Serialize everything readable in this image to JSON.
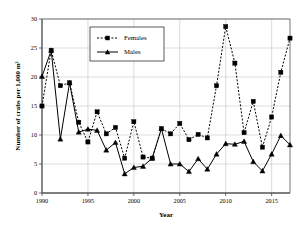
{
  "chart_data": {
    "type": "line",
    "title": "",
    "subtitle": "",
    "xlabel": "Year",
    "ylabel": "Number of crabs per 1,000 m²",
    "xlim": [
      1990,
      2017
    ],
    "ylim": [
      0,
      30
    ],
    "ytick_labels": [
      "0",
      "5",
      "10",
      "15",
      "20",
      "25",
      "30"
    ],
    "yticks": [
      0,
      5,
      10,
      15,
      20,
      25,
      30
    ],
    "xtick_labels": [
      "1990",
      "1995",
      "2000",
      "2005",
      "2010",
      "2015"
    ],
    "xticks": [
      1990,
      1995,
      2000,
      2005,
      2010,
      2015
    ],
    "grid": "horizontal-and-vertical",
    "legend_position": "top-center",
    "x": [
      1990,
      1991,
      1992,
      1993,
      1994,
      1995,
      1996,
      1997,
      1998,
      1999,
      2000,
      2001,
      2002,
      2003,
      2004,
      2005,
      2006,
      2007,
      2008,
      2009,
      2010,
      2011,
      2012,
      2013,
      2014,
      2015,
      2016,
      2017
    ],
    "series": [
      {
        "name": "Females",
        "marker": "square",
        "linestyle": "dashed",
        "color": "#000000",
        "values": [
          15.0,
          24.6,
          18.5,
          19.0,
          12.2,
          8.8,
          14.0,
          10.2,
          11.3,
          6.0,
          12.3,
          6.2,
          6.0,
          11.1,
          10.2,
          12.0,
          9.2,
          10.1,
          9.5,
          18.5,
          28.7,
          22.4,
          10.4,
          15.8,
          7.9,
          13.1,
          20.8,
          26.7
        ]
      },
      {
        "name": "Males",
        "marker": "triangle",
        "linestyle": "solid",
        "color": "#000000",
        "values": [
          20.1,
          24.6,
          9.3,
          19.0,
          10.5,
          11.0,
          10.8,
          7.4,
          8.7,
          3.3,
          4.4,
          4.6,
          6.0,
          11.1,
          5.0,
          5.0,
          3.7,
          5.9,
          4.1,
          6.7,
          8.5,
          8.4,
          8.9,
          5.4,
          3.8,
          6.7,
          9.9,
          8.3
        ]
      }
    ]
  },
  "legend": {
    "items": [
      {
        "label": "Females"
      },
      {
        "label": "Males"
      }
    ]
  },
  "axes": {
    "y_title": "Number of crabs per 1,000 m²",
    "x_title": "Year"
  }
}
